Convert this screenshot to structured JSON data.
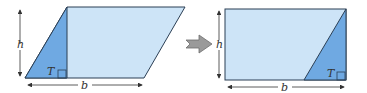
{
  "figure": {
    "left_shape": {
      "name": "parallelogram",
      "height_label": "h",
      "base_label": "b",
      "triangle_label": "T"
    },
    "right_shape": {
      "name": "rectangle",
      "height_label": "h",
      "base_label": "b",
      "triangle_label": "T"
    },
    "transform_arrow": "arrow-right"
  },
  "colors": {
    "light_fill": "#cde4f7",
    "dark_fill": "#6fa9e2",
    "outline": "#2b3f55",
    "arrow": "#8c8c8c"
  }
}
